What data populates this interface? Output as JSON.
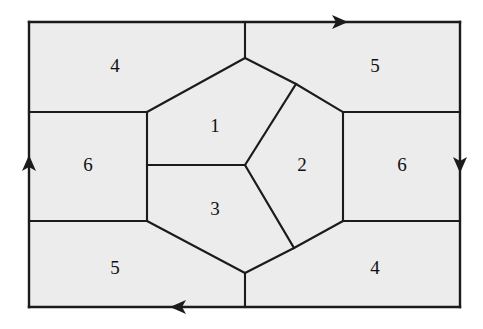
{
  "figure": {
    "background_color": "#ffffff",
    "face_fill_color": "#ececec",
    "line_color": "#1b1b1b",
    "outer_rect": {
      "x1": 29,
      "y1": 22,
      "x2": 460,
      "y2": 307
    },
    "regions": [
      {
        "id": "region-top-left",
        "label": "4",
        "cx": 115,
        "cy": 68
      },
      {
        "id": "region-top-right",
        "label": "5",
        "cx": 375,
        "cy": 68
      },
      {
        "id": "region-mid-left",
        "label": "6",
        "cx": 88,
        "cy": 167
      },
      {
        "id": "region-mid-right",
        "label": "6",
        "cx": 402,
        "cy": 167
      },
      {
        "id": "region-bottom-left",
        "label": "5",
        "cx": 115,
        "cy": 270
      },
      {
        "id": "region-bottom-right",
        "label": "4",
        "cx": 375,
        "cy": 270
      },
      {
        "id": "region-center-one",
        "label": "1",
        "cx": 215,
        "cy": 128
      },
      {
        "id": "region-center-two",
        "label": "2",
        "cx": 302,
        "cy": 167
      },
      {
        "id": "region-center-three",
        "label": "3",
        "cx": 215,
        "cy": 211
      }
    ],
    "arrows": [
      {
        "id": "arrow-top",
        "direction": "right",
        "x": 340,
        "y": 22
      },
      {
        "id": "arrow-right",
        "direction": "down",
        "x": 460,
        "y": 165
      },
      {
        "id": "arrow-bottom",
        "direction": "left",
        "x": 178,
        "y": 307
      },
      {
        "id": "arrow-left",
        "direction": "up",
        "x": 29,
        "y": 163
      }
    ],
    "vertices": {
      "top_center": {
        "x": 245,
        "y": 58
      },
      "bottom_center": {
        "x": 245,
        "y": 273
      },
      "center": {
        "x": 245,
        "y": 165
      },
      "left_upper": {
        "x": 147,
        "y": 112
      },
      "left_lower": {
        "x": 147,
        "y": 221
      },
      "right_upper": {
        "x": 343,
        "y": 112
      },
      "right_lower": {
        "x": 343,
        "y": 221
      },
      "inner_upper_right": {
        "x": 296,
        "y": 84
      },
      "inner_lower_right": {
        "x": 294,
        "y": 248
      }
    }
  }
}
